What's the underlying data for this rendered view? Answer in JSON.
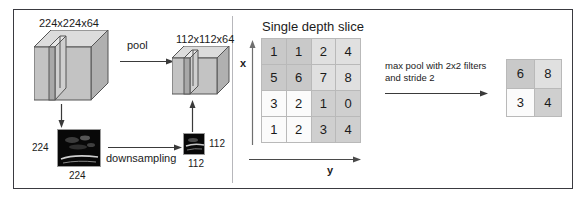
{
  "figure": {
    "divider_color": "#b7b7bb",
    "frame_color": "#3a3a40"
  },
  "left_panel": {
    "input_volume_label": "224x224x64",
    "output_volume_label": "112x112x64",
    "pool_arrow_label": "pool",
    "downsampling_arrow_label": "downsampling",
    "input_image": {
      "side_label": "224",
      "bottom_label": "224"
    },
    "output_image": {
      "side_label": "112",
      "bottom_label": "112"
    }
  },
  "right_panel": {
    "title": "Single depth slice",
    "axis_x_label": "x",
    "axis_y_label": "y",
    "operation_label_line1": "max pool with 2x2 filters",
    "operation_label_line2": "and stride 2",
    "input_matrix": {
      "rows": 4,
      "cols": 4,
      "values": [
        [
          1,
          1,
          2,
          4
        ],
        [
          5,
          6,
          7,
          8
        ],
        [
          3,
          2,
          1,
          0
        ],
        [
          1,
          2,
          3,
          4
        ]
      ],
      "quadrant_shading": [
        [
          "q-a",
          "q-a",
          "q-b",
          "q-b"
        ],
        [
          "q-a",
          "q-a",
          "q-b",
          "q-b"
        ],
        [
          "q-c",
          "q-c",
          "q-d",
          "q-d"
        ],
        [
          "q-c",
          "q-c",
          "q-d",
          "q-d"
        ]
      ]
    },
    "output_matrix": {
      "rows": 2,
      "cols": 2,
      "values": [
        [
          6,
          8
        ],
        [
          3,
          4
        ]
      ],
      "quadrant_shading": [
        [
          "q-a",
          "q-b"
        ],
        [
          "q-c",
          "q-d"
        ]
      ]
    }
  },
  "colors": {
    "quadrant_top_left": "#c9c9c9",
    "quadrant_top_right": "#e0e0e0",
    "quadrant_bottom_left": "#fbfbfb",
    "quadrant_bottom_right": "#cfcfcf",
    "cube_face_front": "#c3c3c3",
    "cube_face_top": "#dcdcdc",
    "cube_face_side": "#b0b0b0",
    "stroke": "#555555"
  }
}
